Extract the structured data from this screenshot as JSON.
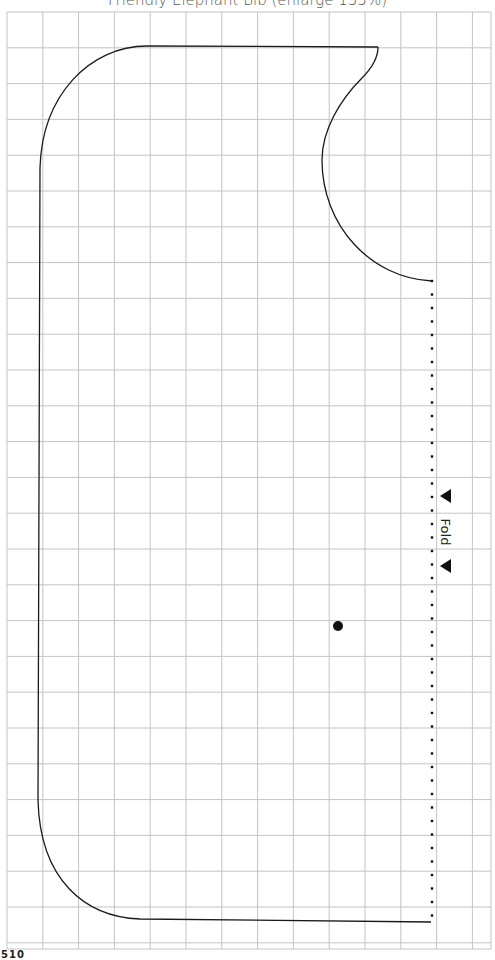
{
  "title": "Friendly Elephant Bib (enlarge 133%)",
  "page_number": "510",
  "fold": {
    "label": "Fold",
    "arrow_icon": "left-triangle"
  },
  "colors": {
    "grid": "#c4c4c4",
    "outline": "#1a1a1a",
    "dots": "#111111",
    "title": "#555555"
  },
  "grid": {
    "x0": 7,
    "y0": 12,
    "x1": 491,
    "y1": 949,
    "spacing": 35.8,
    "columns": 13,
    "rows": 26
  },
  "pattern": {
    "outline_path": "M 378 47 L 147 46 C 90 46 42 95 40 168 L 38 800 C 40 880 85 917 140 919 L 431 922",
    "neck_path": "M 378 47 C 378 60 370 70 362 78 C 340 100 322 130 322 160 C 322 225 370 278 432 281",
    "fold_line": {
      "x": 432,
      "y_start": 281,
      "y_end": 922,
      "dot_spacing": 13.5
    },
    "center_marker": {
      "x": 338,
      "y": 626,
      "r": 5
    }
  }
}
